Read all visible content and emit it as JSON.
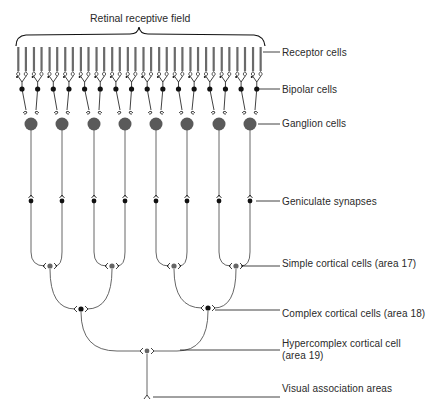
{
  "title": "Retinal receptive field",
  "colors": {
    "line": "#555555",
    "dark": "#111111",
    "ganglion": "#5a5a5a",
    "cortical": "#666666",
    "receptor": "#6a6a6a"
  },
  "labels": {
    "receptor": "Receptor cells",
    "bipolar": "Bipolar cells",
    "ganglion": "Ganglion cells",
    "geniculate": "Geniculate synapses",
    "simple": "Simple cortical cells (area 17)",
    "complex": "Complex cortical cells (area 18)",
    "hypercomplex_line1": "Hypercomplex cortical cell",
    "hypercomplex_line2": "(area 19)",
    "association": "Visual association areas"
  },
  "layout": {
    "receptor_count": 32,
    "bipolar_count": 16,
    "ganglion_x": [
      31,
      62,
      94,
      125,
      156,
      187,
      219,
      250
    ],
    "ganglion_y": 124,
    "bipolar_y": 89,
    "geniculate_y": 201,
    "simple_cells": [
      {
        "x": 50,
        "y": 266
      },
      {
        "x": 112,
        "y": 266
      },
      {
        "x": 174,
        "y": 266
      },
      {
        "x": 236,
        "y": 266
      }
    ],
    "complex_cells": [
      {
        "x": 81,
        "y": 309
      },
      {
        "x": 208,
        "y": 308
      }
    ],
    "hypercomplex_cell": {
      "x": 147,
      "y": 351
    },
    "association_y": 395
  }
}
